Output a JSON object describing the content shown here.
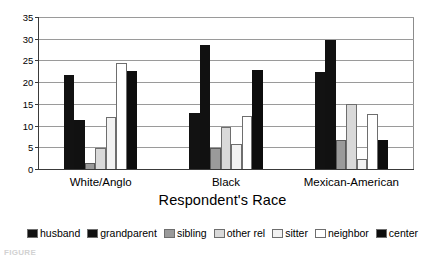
{
  "chart_data": {
    "type": "bar",
    "title": "",
    "xlabel": "Respondent's Race",
    "ylabel": "",
    "categories": [
      "White/Anglo",
      "Black",
      "Mexican-American"
    ],
    "ylim": [
      0,
      35
    ],
    "yticks": [
      0,
      5,
      10,
      15,
      20,
      25,
      30,
      35
    ],
    "grid": true,
    "legend_position": "bottom",
    "series": [
      {
        "name": "husband",
        "color": "#121212",
        "values": [
          21.8,
          13.2,
          22.6
        ]
      },
      {
        "name": "grandparent",
        "color": "#111111",
        "values": [
          11.5,
          28.7,
          30.0
        ]
      },
      {
        "name": "sibling",
        "color": "#9a9a9a",
        "values": [
          1.6,
          5.0,
          7.0
        ]
      },
      {
        "name": "other rel",
        "color": "#d9d9d9",
        "values": [
          5.0,
          9.9,
          15.1
        ]
      },
      {
        "name": "sitter",
        "color": "#f2f2f2",
        "values": [
          12.2,
          6.0,
          2.6
        ]
      },
      {
        "name": "neighbor",
        "color": "#ffffff",
        "values": [
          24.7,
          12.4,
          13.0
        ]
      },
      {
        "name": "center",
        "color": "#0d0d0d",
        "values": [
          22.8,
          23.0,
          6.9
        ]
      }
    ]
  },
  "axis": {
    "x_title": "Respondent's Race",
    "y_tick_labels": [
      "0",
      "5",
      "10",
      "15",
      "20",
      "25",
      "30",
      "35"
    ],
    "category_labels": [
      "White/Anglo",
      "Black",
      "Mexican-American"
    ]
  },
  "legend": {
    "items": [
      {
        "label": "husband"
      },
      {
        "label": "grandparent"
      },
      {
        "label": "sibling"
      },
      {
        "label": "other rel"
      },
      {
        "label": "sitter"
      },
      {
        "label": "neighbor"
      },
      {
        "label": "center"
      }
    ]
  },
  "caption": {
    "text": "FIGURE"
  }
}
